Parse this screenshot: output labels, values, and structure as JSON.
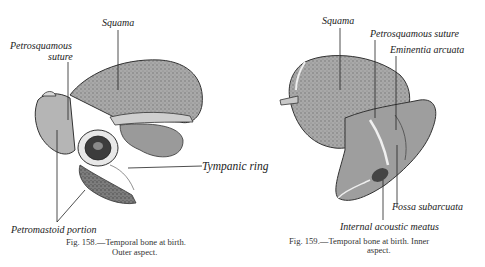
{
  "figures": [
    {
      "id": "fig-158",
      "caption_line1": "Fig. 158.—Temporal bone at birth.",
      "caption_line2": "Outer aspect.",
      "labels": {
        "squama": "Squama",
        "petrosquamous_1": "Petrosquamous",
        "petrosquamous_2": "suture",
        "tympanic_ring": "Tympanic ring",
        "petromastoid": "Petromastoid portion"
      }
    },
    {
      "id": "fig-159",
      "caption_line1": "Fig. 159.—Temporal bone at birth.  Inner",
      "caption_line2": "aspect.",
      "labels": {
        "squama": "Squama",
        "petrosquamous": "Petrosquamous suture",
        "eminentia": "Eminentia arcuata",
        "fossa": "Fossa subarcuata",
        "internal_meatus": "Internal acoustic meatus"
      }
    }
  ],
  "colors": {
    "ink": "#1a1a1a",
    "bone_light": "#bdbdbd",
    "bone_mid": "#8a8a8a",
    "bone_dark": "#4a4a4a"
  }
}
